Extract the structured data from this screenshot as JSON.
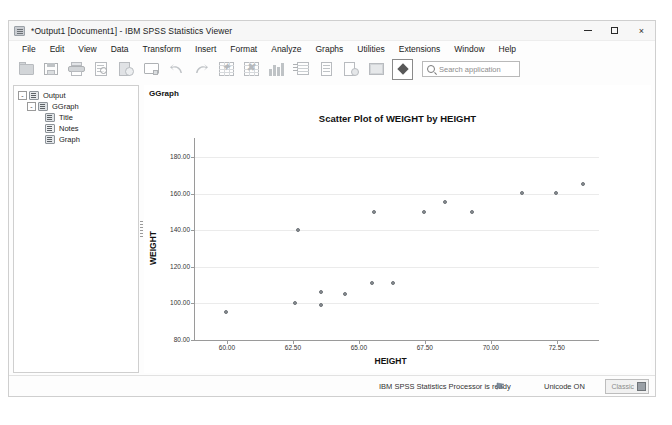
{
  "window": {
    "title": "*Output1 [Document1] - IBM SPSS Statistics Viewer",
    "app_icon": "spss-viewer-icon",
    "controls": {
      "minimize": "minimize-icon",
      "maximize": "maximize-icon",
      "close": "×"
    }
  },
  "menubar": {
    "items": [
      {
        "label": "File"
      },
      {
        "label": "Edit"
      },
      {
        "label": "View"
      },
      {
        "label": "Data"
      },
      {
        "label": "Transform"
      },
      {
        "label": "Insert"
      },
      {
        "label": "Format"
      },
      {
        "label": "Analyze"
      },
      {
        "label": "Graphs"
      },
      {
        "label": "Utilities"
      },
      {
        "label": "Extensions"
      },
      {
        "label": "Window"
      },
      {
        "label": "Help"
      }
    ]
  },
  "toolbar": {
    "buttons": [
      {
        "name": "open-file-icon"
      },
      {
        "name": "save-file-icon"
      },
      {
        "name": "print-icon"
      },
      {
        "name": "print-preview-icon"
      },
      {
        "name": "export-icon"
      },
      {
        "name": "dialog-recall-icon"
      },
      {
        "name": "undo-icon"
      },
      {
        "name": "redo-icon"
      },
      {
        "name": "goto-case-icon"
      },
      {
        "name": "goto-variable-icon"
      },
      {
        "name": "bar-chart-icon"
      },
      {
        "name": "pivot-table-icon"
      },
      {
        "name": "insert-text-icon"
      },
      {
        "name": "insert-object-icon"
      },
      {
        "name": "show-hide-icon"
      },
      {
        "name": "select-icon"
      }
    ],
    "search": {
      "placeholder": "Search application",
      "icon": "search-icon"
    }
  },
  "navigator": {
    "tree": [
      {
        "label": "Output",
        "level": 0,
        "icon": "output-icon",
        "expander": "-"
      },
      {
        "label": "GGraph",
        "level": 1,
        "icon": "ggraph-icon",
        "expander": "-"
      },
      {
        "label": "Title",
        "level": 2,
        "icon": "title-icon",
        "expander": ""
      },
      {
        "label": "Notes",
        "level": 2,
        "icon": "notes-icon",
        "expander": ""
      },
      {
        "label": "Graph",
        "level": 2,
        "icon": "graph-icon",
        "expander": ""
      }
    ]
  },
  "output": {
    "block_label": "GGraph"
  },
  "chart_data": {
    "type": "scatter",
    "title": "Scatter Plot of WEIGHT by HEIGHT",
    "xlabel": "HEIGHT",
    "ylabel": "WEIGHT",
    "xlim": [
      58.75,
      74.1
    ],
    "ylim": [
      80.0,
      185.0
    ],
    "xticks": [
      "60.00",
      "62.50",
      "65.00",
      "67.50",
      "70.00",
      "72.50"
    ],
    "xtick_values": [
      60.0,
      62.5,
      65.0,
      67.5,
      70.0,
      72.5
    ],
    "yticks": [
      "80.00",
      "100.00",
      "120.00",
      "140.00",
      "160.00",
      "180.00"
    ],
    "ytick_values": [
      80,
      100,
      120,
      140,
      160,
      180
    ],
    "grid": "horizontal",
    "legend": "none",
    "marker_color": "#8a8f94",
    "points": [
      {
        "x": 60.0,
        "y": 95.0
      },
      {
        "x": 62.6,
        "y": 100.0
      },
      {
        "x": 62.7,
        "y": 140.0
      },
      {
        "x": 63.6,
        "y": 99.0
      },
      {
        "x": 63.6,
        "y": 106.0
      },
      {
        "x": 64.5,
        "y": 105.0
      },
      {
        "x": 65.5,
        "y": 111.0
      },
      {
        "x": 65.6,
        "y": 150.0
      },
      {
        "x": 66.3,
        "y": 111.0
      },
      {
        "x": 67.5,
        "y": 150.0
      },
      {
        "x": 68.3,
        "y": 155.0
      },
      {
        "x": 69.3,
        "y": 150.0
      },
      {
        "x": 71.2,
        "y": 160.0
      },
      {
        "x": 72.5,
        "y": 160.0
      },
      {
        "x": 73.5,
        "y": 165.0
      }
    ]
  },
  "statusbar": {
    "ready_text": "IBM SPSS Statistics Processor is ready",
    "flag_icon": "processor-flag-icon",
    "unicode": "Unicode ON",
    "classic_label": "Classic",
    "classic_icon": "classic-grid-icon"
  }
}
